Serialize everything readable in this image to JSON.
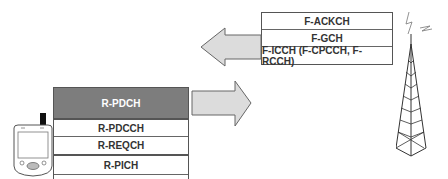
{
  "forward_channels": {
    "rows": [
      {
        "label": "F-ACKCH"
      },
      {
        "label": "F-GCH"
      },
      {
        "label": "F-ICCH (F-CPCCH, F-RCCH)"
      }
    ]
  },
  "reverse_channels": {
    "rows": [
      {
        "label": "R-PDCH",
        "style": "dark"
      },
      {
        "label": "R-PDCCH"
      },
      {
        "label": "R-REQCH"
      },
      {
        "label": "R-PICH"
      }
    ]
  },
  "arrows": {
    "forward_direction": "left",
    "reverse_direction": "right",
    "fill": "#dcdcdc",
    "stroke": "#666666"
  },
  "devices": {
    "mobile": "pda-handset-icon",
    "base_station": "cell-tower-icon"
  },
  "colors": {
    "dark_row": "#7d7d7d",
    "border": "#555555"
  }
}
